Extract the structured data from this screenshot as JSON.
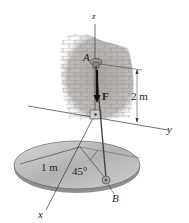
{
  "figure": {
    "labels": {
      "z": "z",
      "y": "y",
      "x": "x",
      "A": "A",
      "B": "B",
      "F": "F",
      "height": "2 m",
      "radius": "1 m",
      "angle": "45°"
    },
    "colors": {
      "wall": "#b9b6b3",
      "plate_top": "#bdbdbd",
      "plate_edge": "#8a8a8a",
      "line": "#333333"
    }
  }
}
